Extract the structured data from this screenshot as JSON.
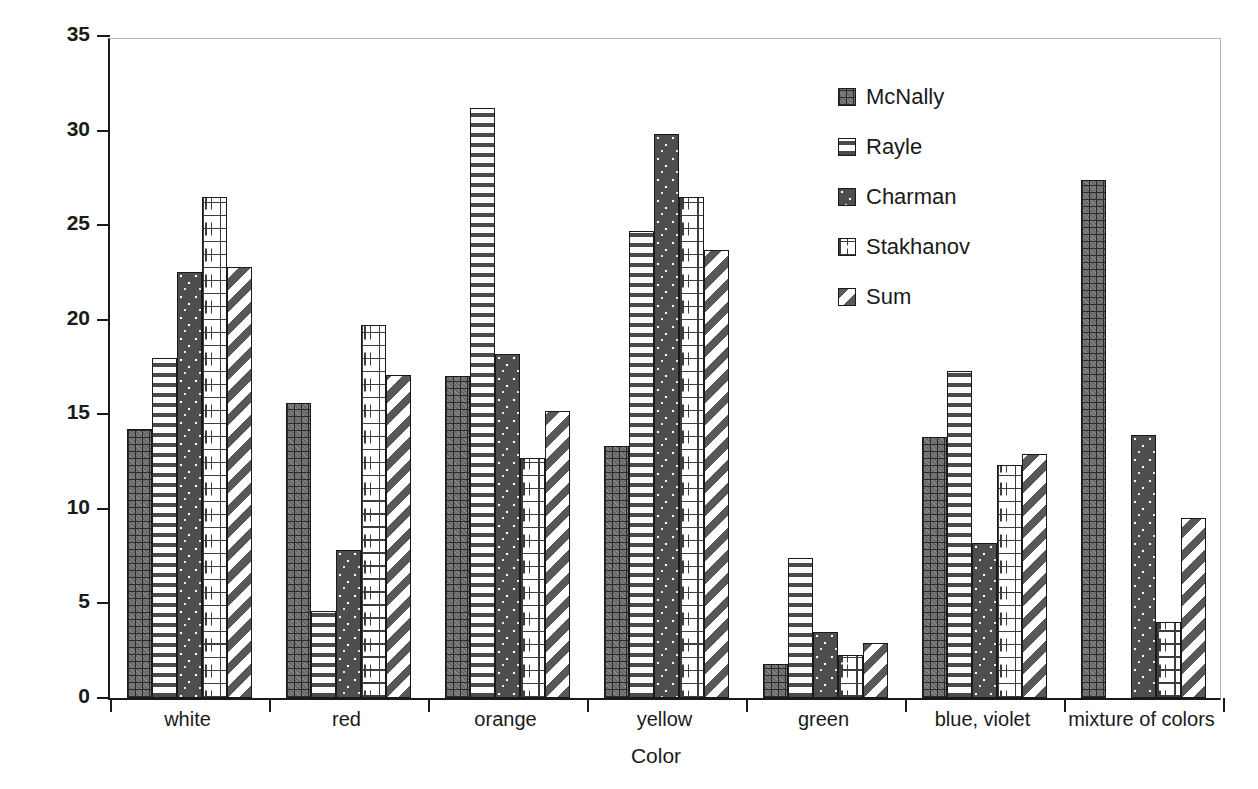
{
  "chart_data": {
    "type": "bar",
    "title": "",
    "xlabel": "Color",
    "ylabel": "Percentage of Sample",
    "ylim": [
      0,
      35
    ],
    "yticks": [
      0,
      5,
      10,
      15,
      20,
      25,
      30,
      35
    ],
    "grid": false,
    "legend_position": "top-right",
    "categories": [
      "white",
      "red",
      "orange",
      "yellow",
      "green",
      "blue, violet",
      "mixture of colors"
    ],
    "series": [
      {
        "name": "McNally",
        "pattern": "grid-crosshatch",
        "values": [
          14.2,
          15.6,
          17.0,
          13.3,
          1.8,
          13.8,
          27.4
        ]
      },
      {
        "name": "Rayle",
        "pattern": "horizontal-stripes",
        "values": [
          18.0,
          4.6,
          31.2,
          24.7,
          7.4,
          17.3,
          0
        ]
      },
      {
        "name": "Charman",
        "pattern": "dark-speckle",
        "values": [
          22.5,
          7.8,
          18.2,
          29.8,
          3.5,
          8.2,
          13.9
        ]
      },
      {
        "name": "Stakhanov",
        "pattern": "brick",
        "values": [
          26.5,
          19.7,
          12.7,
          26.5,
          2.3,
          12.3,
          4.0
        ]
      },
      {
        "name": "Sum",
        "pattern": "diagonal-stripes",
        "values": [
          22.8,
          17.1,
          15.2,
          23.7,
          2.9,
          12.9,
          9.5
        ]
      }
    ]
  },
  "axis": {
    "y_title": "Percentage of Sample",
    "x_title": "Color",
    "y_tick_labels": [
      "0",
      "5",
      "10",
      "15",
      "20",
      "25",
      "30",
      "35"
    ],
    "x_tick_labels": [
      "white",
      "red",
      "orange",
      "yellow",
      "green",
      "blue, violet",
      "mixture of colors"
    ]
  },
  "legend": {
    "entries": [
      {
        "label": "McNally"
      },
      {
        "label": "Rayle"
      },
      {
        "label": "Charman"
      },
      {
        "label": "Stakhanov"
      },
      {
        "label": "Sum"
      }
    ]
  },
  "colors": {
    "axis": "#1a1a1a",
    "frame": "#b9b9b9",
    "background": "#ffffff",
    "bar_dark": "#4e4e4e",
    "bar_light": "#ffffff"
  }
}
